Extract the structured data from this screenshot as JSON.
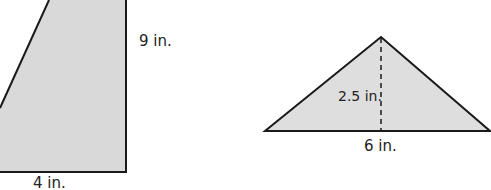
{
  "figures": {
    "trapezoid": {
      "height_label": "9 in.",
      "base_label": "4 in.",
      "fill": "#d9d9d9",
      "stroke": "#1a1a1a"
    },
    "triangle": {
      "height_label": "2.5 in.",
      "base_label": "6 in.",
      "fill": "#dedede",
      "stroke": "#1a1a1a"
    }
  }
}
